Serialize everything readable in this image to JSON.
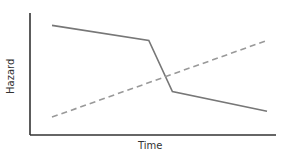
{
  "chart_data": {
    "type": "line",
    "title": "",
    "xlabel": "Time",
    "ylabel": "Hazard",
    "grid": false,
    "legend": null,
    "ticks": {
      "x": [],
      "y": []
    },
    "x": [
      0,
      0.45,
      0.56,
      1.0
    ],
    "series": [
      {
        "name": "solid",
        "style": "solid",
        "color": "#777777",
        "points": [
          [
            0,
            0.91
          ],
          [
            0.45,
            0.78
          ],
          [
            0.56,
            0.34
          ],
          [
            1.0,
            0.17
          ]
        ]
      },
      {
        "name": "dashed",
        "style": "dashed",
        "color": "#999999",
        "points": [
          [
            0,
            0.12
          ],
          [
            1.0,
            0.78
          ]
        ]
      }
    ],
    "xlim": [
      0,
      1
    ],
    "ylim": [
      0,
      1
    ]
  },
  "labels": {
    "x": "Time",
    "y": "Hazard"
  },
  "colors": {
    "axis": "#333333",
    "solid_line": "#777777",
    "dashed_line": "#999999"
  }
}
